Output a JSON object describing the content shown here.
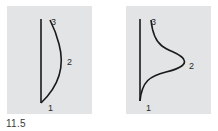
{
  "figure": {
    "caption": "11.5",
    "panels": [
      {
        "id": "a",
        "description": "straight vertical line with a single convex arc bulging right",
        "labels": {
          "p1": "1",
          "p2": "2",
          "p3": "3"
        }
      },
      {
        "id": "b",
        "description": "straight vertical line with a bell-shaped curve peaking right at point 2",
        "labels": {
          "p1": "1",
          "p2": "2",
          "p3": "3"
        }
      }
    ],
    "colors": {
      "panel_bg": "#e3e4e5",
      "stroke": "#1a1a1a",
      "text": "#2a2a2a"
    }
  }
}
